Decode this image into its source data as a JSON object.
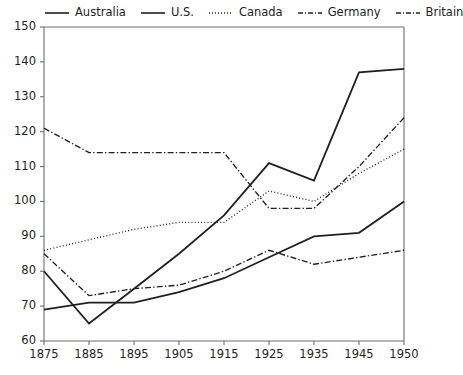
{
  "chart_data": {
    "type": "line",
    "title": "",
    "subtitle": "",
    "xlabel": "",
    "ylabel": "",
    "x": [
      "1875",
      "1885",
      "1895",
      "1905",
      "1915",
      "1925",
      "1935",
      "1945",
      "1950"
    ],
    "categories": [
      "1875",
      "1885",
      "1895",
      "1905",
      "1915",
      "1925",
      "1935",
      "1945",
      "1950"
    ],
    "xlim": [
      0,
      8
    ],
    "ylim": [
      60,
      150
    ],
    "ytick_labels": [
      "60",
      "70",
      "80",
      "90",
      "100",
      "110",
      "120",
      "130",
      "140",
      "150"
    ],
    "ytick_values": [
      60,
      70,
      80,
      90,
      100,
      110,
      120,
      130,
      140,
      150
    ],
    "xtick_labels": [
      "1875",
      "1885",
      "1895",
      "1905",
      "1915",
      "1925",
      "1935",
      "1945",
      "1950"
    ],
    "grid": false,
    "legend_position": "top",
    "series": [
      {
        "name": "Australia",
        "style": "solid",
        "color": "#231f20",
        "values": [
          69,
          71,
          71,
          74,
          78,
          84,
          90,
          91,
          100
        ]
      },
      {
        "name": "U.S.",
        "style": "solid",
        "color": "#231f20",
        "values": [
          80,
          65,
          75,
          85,
          96,
          111,
          106,
          137,
          138
        ]
      },
      {
        "name": "Canada",
        "style": "dotted",
        "color": "#231f20",
        "values": [
          86,
          89,
          92,
          94,
          94,
          103,
          100,
          108,
          115
        ]
      },
      {
        "name": "Germany",
        "style": "dashdot",
        "color": "#231f20",
        "values": [
          85,
          73,
          75,
          76,
          80,
          86,
          82,
          84,
          86
        ]
      },
      {
        "name": "Britain",
        "style": "dashdot",
        "color": "#231f20",
        "values": [
          121,
          114,
          114,
          114,
          114,
          98,
          98,
          110,
          124
        ]
      }
    ],
    "legend_entries": [
      "Australia",
      "U.S.",
      "Canada",
      "Germany",
      "Britain"
    ]
  },
  "legend": {
    "items": [
      {
        "label": "Australia",
        "key": "solid-line-key"
      },
      {
        "label": "U.S.",
        "key": "solid-line-key"
      },
      {
        "label": "Canada",
        "key": "dotted-line-key"
      },
      {
        "label": "Germany",
        "key": "dashdot-line-key"
      },
      {
        "label": "Britain",
        "key": "dashdot-line-key"
      }
    ]
  }
}
